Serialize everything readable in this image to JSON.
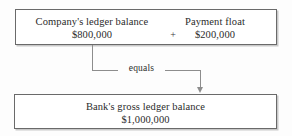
{
  "diagram": {
    "type": "flow-equation",
    "top_box": {
      "left_item": {
        "label": "Company's ledger balance",
        "amount": "$800,000"
      },
      "operator": "+",
      "right_item": {
        "label": "Payment float",
        "amount": "$200,000"
      }
    },
    "connector": {
      "label": "equals",
      "arrow": "down-arrow-icon"
    },
    "bottom_box": {
      "label": "Bank's gross ledger balance",
      "amount": "$1,000,000"
    }
  },
  "colors": {
    "border": "#6a6a6a",
    "line": "#8d8d8d",
    "text": "#2b2b2b",
    "background": "#fdfdfd"
  }
}
